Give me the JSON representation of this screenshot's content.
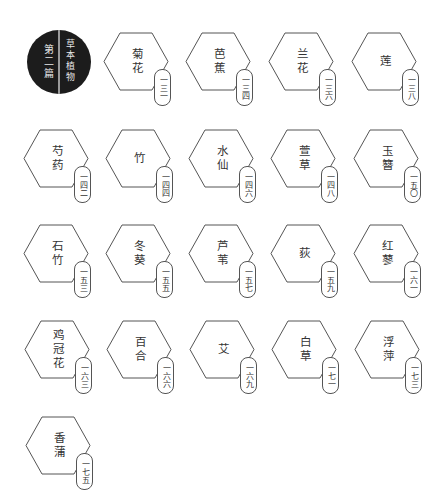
{
  "chapter": {
    "label": "第二篇",
    "title": "草本植物",
    "colors": {
      "seal_bg": "#1c1c1c",
      "seal_text": "#e6e6e6",
      "seal_divider": "#9a9a9a"
    }
  },
  "style": {
    "hex_stroke": "#555555",
    "text_color": "#333333"
  },
  "entries": [
    {
      "name": "菊花",
      "page": "一三一"
    },
    {
      "name": "芭蕉",
      "page": "一三四"
    },
    {
      "name": "兰花",
      "page": "一三六"
    },
    {
      "name": "莲",
      "page": "一三八"
    },
    {
      "name": "芍药",
      "page": "一四二"
    },
    {
      "name": "竹",
      "page": "一四四"
    },
    {
      "name": "水仙",
      "page": "一四六"
    },
    {
      "name": "萱草",
      "page": "一四八"
    },
    {
      "name": "玉簪",
      "page": "一五〇"
    },
    {
      "name": "石竹",
      "page": "一五三"
    },
    {
      "name": "冬葵",
      "page": "一五五"
    },
    {
      "name": "芦苇",
      "page": "一五七"
    },
    {
      "name": "荻",
      "page": "一五九"
    },
    {
      "name": "红蓼",
      "page": "一六一"
    },
    {
      "name": "鸡冠花",
      "page": "一六三"
    },
    {
      "name": "百合",
      "page": "一六六"
    },
    {
      "name": "艾",
      "page": "一六九"
    },
    {
      "name": "白草",
      "page": "一七一"
    },
    {
      "name": "浮萍",
      "page": "一七三"
    },
    {
      "name": "香蒲",
      "page": "一七五"
    }
  ]
}
